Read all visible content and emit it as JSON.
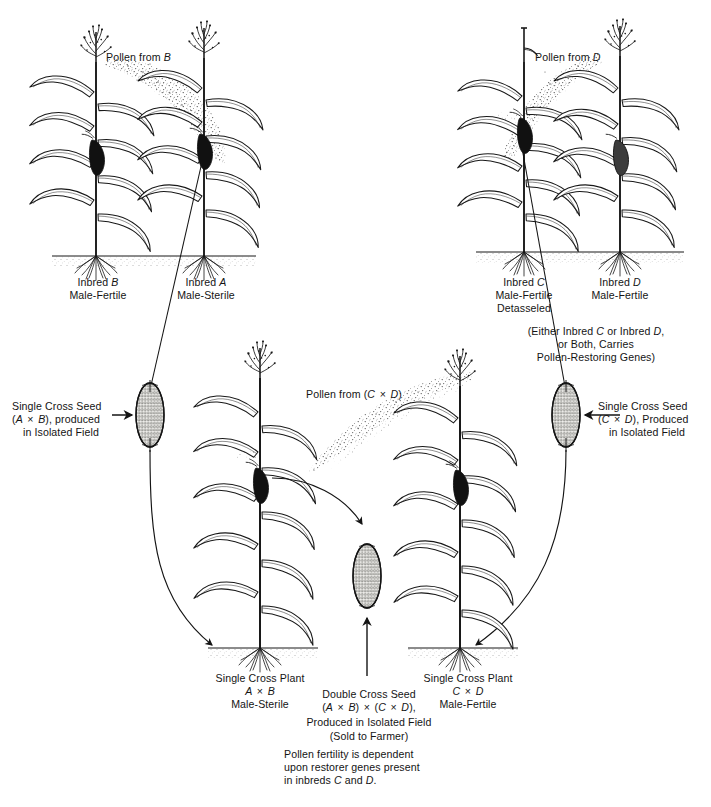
{
  "figure": {
    "type": "diagram",
    "background_color": "#ffffff",
    "ink_color": "#141414"
  },
  "top_left_cross": {
    "pollen_label": "Pollen from B",
    "pollen_parent_letter": "B",
    "plants": [
      {
        "name_line1": "Inbred B",
        "letter": "B",
        "name_line2": "Male-Fertile",
        "role": "pollen-parent"
      },
      {
        "name_line1": "Inbred A",
        "letter": "A",
        "name_line2": "Male-Sterile",
        "role": "seed-parent"
      }
    ]
  },
  "top_right_cross": {
    "pollen_label": "Pollen from D",
    "pollen_parent_letter": "D",
    "plants": [
      {
        "name_line1": "Inbred C",
        "letter": "C",
        "name_line2": "Male-Fertile",
        "name_line3": "Detasseled",
        "role": "seed-parent"
      },
      {
        "name_line1": "Inbred D",
        "letter": "D",
        "name_line2": "Male-Fertile",
        "role": "pollen-parent"
      }
    ],
    "note_line1": "(Either Inbred C or Inbred D,",
    "note_line2": "or Both, Carries",
    "note_line3": "Pollen-Restoring Genes)"
  },
  "left_seed": {
    "line1": "Single Cross Seed",
    "line2": "(A × B), produced",
    "line3": "in Isolated Field",
    "cross": "A × B"
  },
  "right_seed": {
    "line1": "Single Cross Seed",
    "line2": "(C × D), Produced",
    "line3": "in Isolated Field",
    "cross": "C × D"
  },
  "middle_pollen": {
    "label": "Pollen from (C × D)"
  },
  "bottom_left_plant": {
    "line1": "Single Cross Plant",
    "line2": "A × B",
    "line3": "Male-Sterile"
  },
  "bottom_right_plant": {
    "line1": "Single Cross Plant",
    "line2": "C × D",
    "line3": "Male-Fertile"
  },
  "double_cross_seed": {
    "line1": "Double Cross Seed",
    "line2": "(A × B) × (C × D),",
    "line3": "Produced in Isolated Field",
    "line4": "(Sold to Farmer)"
  },
  "footnote": {
    "line1": "Pollen fertility is dependent",
    "line2": "upon restorer genes present",
    "line3": "in inbreds C and D."
  }
}
